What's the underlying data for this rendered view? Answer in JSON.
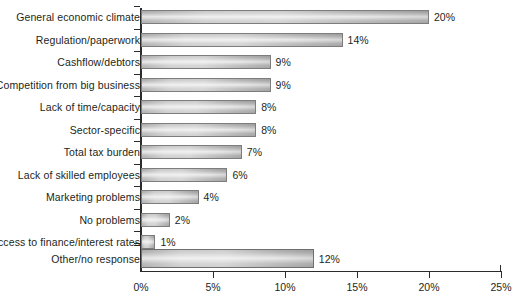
{
  "chart_data": {
    "type": "bar",
    "orientation": "horizontal",
    "title": "",
    "xlabel": "",
    "ylabel": "",
    "xlim": [
      0,
      25
    ],
    "grid": false,
    "legend": null,
    "categories": [
      "General economic climate",
      "Regulation/paperwork",
      "Cashflow/debtors",
      "Competition from big business",
      "Lack of time/capacity",
      "Sector-specific",
      "Total tax burden",
      "Lack of skilled employees",
      "Marketing problems",
      "No problems",
      "Access to finance/interest rates",
      "Other/no response"
    ],
    "values": [
      20,
      14,
      9,
      9,
      8,
      8,
      7,
      6,
      4,
      2,
      1,
      12
    ],
    "value_labels": [
      "20%",
      "14%",
      "9%",
      "9%",
      "8%",
      "8%",
      "7%",
      "6%",
      "4%",
      "2%",
      "1%",
      "12%"
    ],
    "xticks": [
      0,
      5,
      10,
      15,
      20,
      25
    ],
    "xtick_labels": [
      "0%",
      "5%",
      "10%",
      "15%",
      "20%",
      "25%"
    ],
    "bar_color": "#cfcfcf",
    "bar_border_color": "#7d7d7d",
    "text_color": "#231f20",
    "axis_color": "#2b2b2b",
    "background_color": "#ffffff"
  }
}
